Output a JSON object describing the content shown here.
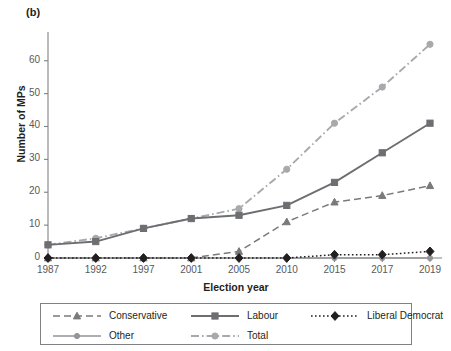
{
  "panel": {
    "label": "(b)"
  },
  "axes": {
    "ylabel": "Number of MPs",
    "xlabel": "Election year",
    "yticks": [
      "0",
      "10",
      "20",
      "30",
      "40",
      "50",
      "60"
    ],
    "xticks": [
      "1987",
      "1992",
      "1997",
      "2001",
      "2005",
      "2010",
      "2015",
      "2017",
      "2019"
    ]
  },
  "legend": {
    "items": [
      {
        "label": "Conservative",
        "key": "dashed-triangle-key"
      },
      {
        "label": "Labour",
        "key": "solid-square-key"
      },
      {
        "label": "Liberal Democrat",
        "key": "dotted-diamond-key"
      },
      {
        "label": "Other",
        "key": "solid-circle-key"
      },
      {
        "label": "Total",
        "key": "dashdot-circle-key"
      }
    ]
  },
  "colors": {
    "conservative": "#7a7a7a",
    "labour": "#6d6e71",
    "liberal_democrat": "#231f20",
    "other": "#939598",
    "total": "#a7a9ac",
    "axis": "#808184",
    "text": "#231f20",
    "tick_text": "#58595b"
  },
  "chart_data": {
    "type": "line",
    "title": "",
    "subtitle": "",
    "xlabel": "Election year",
    "ylabel": "Number of MPs",
    "categories": [
      "1987",
      "1992",
      "1997",
      "2001",
      "2005",
      "2010",
      "2015",
      "2017",
      "2019"
    ],
    "ylim": [
      0,
      66
    ],
    "yticks": [
      0,
      10,
      20,
      30,
      40,
      50,
      60
    ],
    "grid": false,
    "legend_position": "bottom",
    "series": [
      {
        "name": "Conservative",
        "values": [
          0,
          0,
          0,
          0,
          2,
          11,
          17,
          19,
          22
        ],
        "linestyle": "dashed",
        "marker": "triangle",
        "color": "#7a7a7a"
      },
      {
        "name": "Labour",
        "values": [
          4,
          5,
          9,
          12,
          13,
          16,
          23,
          32,
          41
        ],
        "linestyle": "solid",
        "marker": "square",
        "color": "#6d6e71"
      },
      {
        "name": "Liberal Democrat",
        "values": [
          0,
          0,
          0,
          0,
          0,
          0,
          1,
          1,
          2
        ],
        "linestyle": "dotted",
        "marker": "diamond",
        "color": "#231f20"
      },
      {
        "name": "Other",
        "values": [
          0,
          0,
          0,
          0,
          0,
          0,
          0,
          0,
          0
        ],
        "linestyle": "solid",
        "marker": "circle",
        "color": "#939598"
      },
      {
        "name": "Total",
        "values": [
          4,
          6,
          9,
          12,
          15,
          27,
          41,
          52,
          65
        ],
        "linestyle": "dashdot",
        "marker": "circle",
        "color": "#a7a9ac"
      }
    ]
  }
}
